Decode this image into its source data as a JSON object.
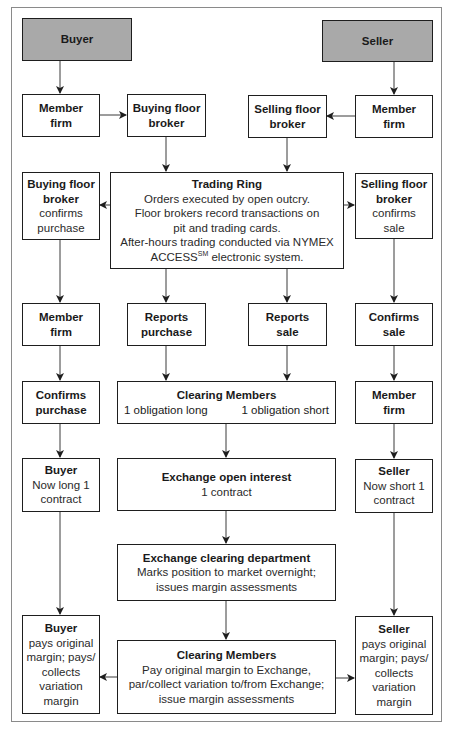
{
  "diagram": {
    "title": "",
    "nodes": {
      "buyer_top": {
        "title": "Buyer"
      },
      "seller_top": {
        "title": "Seller"
      },
      "member_firm_buy": {
        "title": "Member firm"
      },
      "buying_floor_broker": {
        "title": "Buying floor broker"
      },
      "selling_floor_broker": {
        "title": "Selling floor broker"
      },
      "member_firm_sell": {
        "title": "Member firm"
      },
      "buying_broker_confirms": {
        "title": "Buying floor broker",
        "body": "confirms purchase"
      },
      "trading_ring": {
        "title": "Trading Ring",
        "lines": [
          "Orders executed by open outcry.",
          "Floor brokers record transactions on",
          "pit and trading cards.",
          "After-hours trading conducted via NYMEX"
        ],
        "last_line_pre": "ACCESS",
        "last_line_sup": "SM",
        "last_line_post": " electronic system."
      },
      "selling_broker_confirms": {
        "title": "Selling floor broker",
        "body": "confirms sale"
      },
      "member_firm_buy_2": {
        "title": "Member firm"
      },
      "reports_purchase": {
        "title": "Reports purchase"
      },
      "reports_sale": {
        "title": "Reports sale"
      },
      "confirms_sale": {
        "title": "Confirms sale"
      },
      "confirms_purchase": {
        "title": "Confirms purchase"
      },
      "clearing_members_1": {
        "title": "Clearing Members",
        "left": "1 obligation long",
        "right": "1 obligation short"
      },
      "member_firm_sell_2": {
        "title": "Member firm"
      },
      "buyer_long": {
        "title": "Buyer",
        "body": "Now long 1 contract"
      },
      "exchange_open_interest": {
        "title": "Exchange open interest",
        "body": "1 contract"
      },
      "seller_short": {
        "title": "Seller",
        "body": "Now short 1 contract"
      },
      "exchange_clearing_dept": {
        "title": "Exchange clearing department",
        "body": "Marks position to market overnight; issues margin assessments"
      },
      "buyer_pays": {
        "title": "Buyer",
        "body": "pays original margin; pays/ collects variation margin"
      },
      "clearing_members_2": {
        "title": "Clearing Members",
        "body": "Pay original margin to Exchange, par/collect variation to/from Exchange; issue margin assessments"
      },
      "seller_pays": {
        "title": "Seller",
        "body": "pays original margin; pays/ collects variation margin"
      }
    },
    "colors": {
      "party_fill": "#a9a9a9",
      "border": "#1e1e1e",
      "frame": "#8a8a8a"
    }
  }
}
